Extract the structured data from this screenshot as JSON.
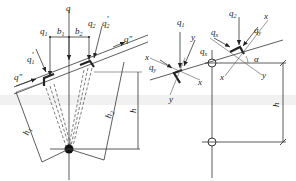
{
  "left_diagram": {
    "labels": {
      "q": "q",
      "q1": "q",
      "q1_sub": "1",
      "b1": "b",
      "b1_sub": "1",
      "b2": "b",
      "b2_sub": "2",
      "q2": "q",
      "q2_sub": "2",
      "q2p": "q",
      "q2p_sub": "2",
      "q2p_prime": "′",
      "q1p": "q",
      "q1p_sub": "1",
      "q1p_prime": "′",
      "qpp_right": "q″",
      "qpp_left": "q″",
      "h1": "h",
      "h1_sub": "1",
      "h2": "h",
      "h2_sub": "2",
      "h": "h"
    }
  },
  "right_diagram": {
    "labels": {
      "q1": "q",
      "q1_sub": "1",
      "q2": "q",
      "q2_sub": "2",
      "qx_left": "q",
      "qx_left_sub": "x",
      "qy_left": "q",
      "qy_left_sub": "y",
      "qx_right": "q",
      "qx_right_sub": "x",
      "qy_right": "q",
      "qy_right_sub": "y",
      "x1": "x",
      "x2": "x",
      "x3": "x",
      "x4": "x",
      "y1": "y",
      "y2": "y",
      "y3": "y",
      "alpha": "α",
      "h": "h"
    }
  }
}
